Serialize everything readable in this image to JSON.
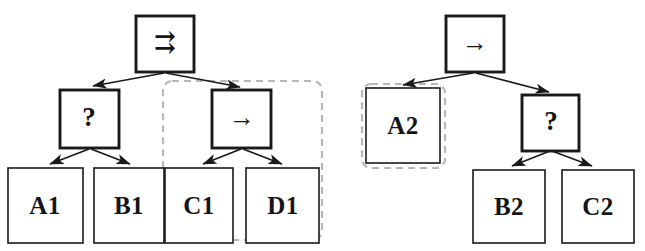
{
  "figure": {
    "background_color": "#ffffff",
    "stroke_color": "#1a1a1a",
    "highlight_color": "#b8b8b8"
  },
  "trees": [
    {
      "id": "tree-1",
      "root": {
        "id": "node-root-1",
        "label": "⇉",
        "icon_name": "rightrightarrows-symbol",
        "emphasis": "thick"
      },
      "children": [
        {
          "id": "node-q-1",
          "label": "?",
          "icon_name": "question-mark-symbol",
          "emphasis": "thick",
          "leaves": [
            {
              "id": "leaf-a1",
              "label": "A1",
              "emphasis": "thin"
            },
            {
              "id": "leaf-b1",
              "label": "B1",
              "emphasis": "thin"
            }
          ]
        },
        {
          "id": "node-arrow-1",
          "label": "→",
          "icon_name": "rightarrow-symbol",
          "emphasis": "thick",
          "leaves": [
            {
              "id": "leaf-c1",
              "label": "C1",
              "emphasis": "thin"
            },
            {
              "id": "leaf-d1",
              "label": "D1",
              "emphasis": "thin"
            }
          ]
        }
      ],
      "highlight": {
        "id": "highlight-1",
        "name": "dashed-subterm-region-right",
        "covers": [
          "node-arrow-1",
          "leaf-c1",
          "leaf-d1"
        ]
      }
    },
    {
      "id": "tree-2",
      "root": {
        "id": "node-root-2",
        "label": "→",
        "icon_name": "rightarrow-symbol",
        "emphasis": "thick"
      },
      "children": [
        {
          "id": "leaf-a2",
          "label": "A2",
          "emphasis": "thin",
          "leaves": []
        },
        {
          "id": "node-q-2",
          "label": "?",
          "icon_name": "question-mark-symbol",
          "emphasis": "thick",
          "leaves": [
            {
              "id": "leaf-b2",
              "label": "B2",
              "emphasis": "thin"
            },
            {
              "id": "leaf-c2",
              "label": "C2",
              "emphasis": "thin"
            }
          ]
        }
      ],
      "highlight": {
        "id": "highlight-2",
        "name": "dashed-subterm-region-a2",
        "covers": [
          "leaf-a2"
        ]
      }
    }
  ]
}
